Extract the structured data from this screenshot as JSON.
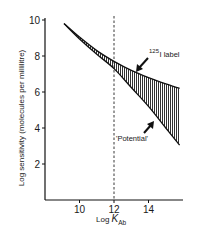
{
  "chart_data": {
    "type": "area",
    "title": "",
    "xlabel": "Log K_Ab",
    "xlabel_main": "Log ",
    "xlabel_var": "K",
    "xlabel_sub": "Ab",
    "ylabel": "Log sensitivity (molecules per millilitre)",
    "xlim": [
      7.9,
      16.0
    ],
    "ylim": [
      0,
      10
    ],
    "x_ticks": [
      10,
      12,
      14
    ],
    "y_ticks": [
      2,
      4,
      6,
      8,
      10
    ],
    "grid": false,
    "legend": null,
    "reference_line": {
      "x": 12,
      "style": "dashed"
    },
    "series": [
      {
        "name": "125I label",
        "description": "upper boundary curve",
        "x": [
          9.1,
          10,
          11,
          12,
          13,
          14,
          15,
          15.8
        ],
        "y": [
          9.8,
          9.05,
          8.3,
          7.7,
          7.2,
          6.8,
          6.45,
          6.2
        ]
      },
      {
        "name": "Potential",
        "description": "lower boundary line",
        "x": [
          9.1,
          10,
          11,
          12,
          13,
          14,
          15,
          15.8
        ],
        "y": [
          9.8,
          8.95,
          8.1,
          7.3,
          6.25,
          5.2,
          4.0,
          3.05
        ]
      }
    ],
    "shaded_region": "between 125I label curve and Potential line (vertical hatching)",
    "annotations": [
      {
        "text": "125I label",
        "superscript": "125",
        "main": "I label",
        "points_to": "upper curve near x=13.4"
      },
      {
        "text": "'Potential'",
        "points_to": "lower line near x=14.2"
      }
    ]
  }
}
